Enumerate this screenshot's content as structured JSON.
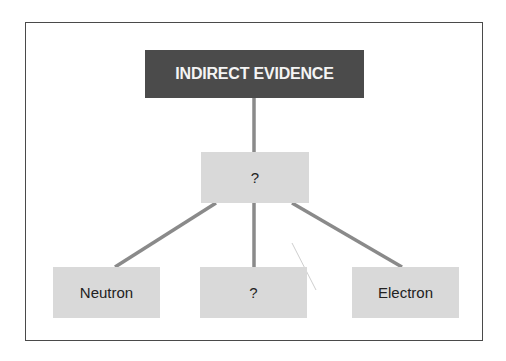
{
  "diagram": {
    "type": "tree",
    "root": {
      "label": "INDIRECT EVIDENCE",
      "color": "#4b4b4b",
      "text_color": "#f4f4f4"
    },
    "middle": {
      "label": "?",
      "color": "#d9d9d9"
    },
    "leaves": [
      {
        "label": "Neutron",
        "color": "#d9d9d9"
      },
      {
        "label": "?",
        "color": "#d9d9d9"
      },
      {
        "label": "Electron",
        "color": "#d9d9d9"
      }
    ],
    "connector_color": "#8a8a8a",
    "frame_color": "#4a4a4a"
  }
}
